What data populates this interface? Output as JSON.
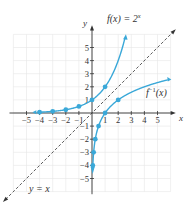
{
  "chart_data": {
    "type": "line",
    "title": "",
    "xlabel": "x",
    "ylabel": "y",
    "xlim": [
      -6,
      6
    ],
    "ylim": [
      -6,
      6
    ],
    "grid": true,
    "x_ticks": [
      -5,
      -4,
      -3,
      -2,
      -1,
      1,
      2,
      3,
      4,
      5
    ],
    "y_ticks": [
      -5,
      -4,
      -3,
      -2,
      -1,
      1,
      2,
      3,
      4,
      5
    ],
    "series": [
      {
        "name": "f(x) = 2^x",
        "style": "solid",
        "color": "#3aa8d8",
        "points": [
          [
            -4,
            0.0625
          ],
          [
            -3,
            0.125
          ],
          [
            -2,
            0.25
          ],
          [
            -1,
            0.5
          ],
          [
            0,
            1
          ],
          [
            1,
            2
          ]
        ]
      },
      {
        "name": "f^-1(x)",
        "style": "solid",
        "color": "#3aa8d8",
        "points": [
          [
            0.0625,
            -4
          ],
          [
            0.125,
            -3
          ],
          [
            0.25,
            -2
          ],
          [
            0.5,
            -1
          ],
          [
            1,
            0
          ],
          [
            2,
            1
          ]
        ]
      },
      {
        "name": "y = x",
        "style": "dashed",
        "color": "#333333",
        "points": [
          [
            -6,
            -6
          ],
          [
            6,
            6
          ]
        ]
      }
    ],
    "annotations": [
      {
        "text": "f(x) = 2",
        "sup": "x",
        "near": [
          1.2,
          5.9
        ]
      },
      {
        "text": "f",
        "sup": "−1",
        "suffix": "(x)",
        "near": [
          4.1,
          1.7
        ]
      },
      {
        "text": "y = x",
        "near": [
          -4.5,
          -5.8
        ]
      }
    ]
  },
  "labels": {
    "x_axis": "x",
    "y_axis": "y",
    "f_label_base": "f(x) = 2",
    "f_label_exp": "x",
    "finv_label_base": "f",
    "finv_label_exp": "−1",
    "finv_label_arg": "(x)",
    "line_label": "y = x"
  },
  "colors": {
    "curve": "#3aa8d8",
    "axis": "#333333",
    "grid": "#e6e6e6"
  }
}
